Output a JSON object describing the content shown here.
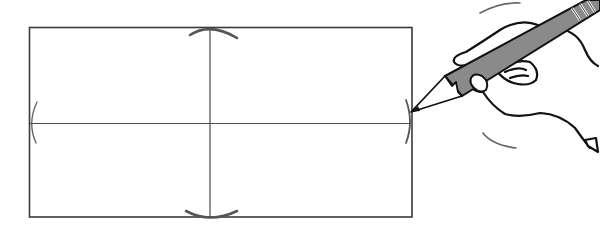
{
  "figure": {
    "canvas": {
      "width": 600,
      "height": 234,
      "background": "#ffffff"
    },
    "colors": {
      "line": "#3a3a3a",
      "arc": "#555555",
      "pencil_fill": "#8a8a8a",
      "ink": "#111111"
    },
    "rectangle": {
      "x1": 29,
      "y1": 27,
      "x2": 412,
      "y2": 217
    },
    "center_lines": {
      "vertical_x": 210,
      "horizontal_y": 123
    },
    "arcs": [
      {
        "name": "top-arc",
        "position": "top of vertical center line"
      },
      {
        "name": "bottom-arc",
        "position": "bottom of vertical center line"
      },
      {
        "name": "left-arc",
        "position": "left end of horizontal center line"
      },
      {
        "name": "right-arc",
        "position": "right end of horizontal center line"
      }
    ],
    "hand": {
      "holding": "pencil",
      "pencil_tip": {
        "x": 411,
        "y": 112
      },
      "motion_marks": 2
    }
  }
}
